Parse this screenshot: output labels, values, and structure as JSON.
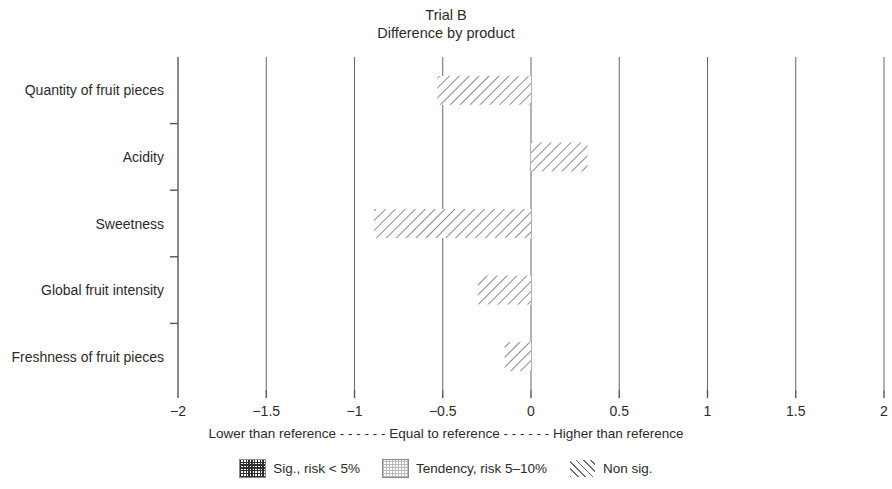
{
  "chart_data": {
    "type": "bar",
    "orientation": "horizontal",
    "title": "Trial B",
    "subtitle": "Difference by product",
    "xlabel": "",
    "ylabel": "",
    "xlim": [
      -2,
      2
    ],
    "xticks": [
      "−2",
      "−1.5",
      "−1",
      "−0.5",
      "0",
      "0.5",
      "1",
      "1.5",
      "2"
    ],
    "xtick_values": [
      -2,
      -1.5,
      -1,
      -0.5,
      0,
      0.5,
      1,
      1.5,
      2
    ],
    "grid": true,
    "grid_axis": "x",
    "categories": [
      "Quantity of fruit pieces",
      "Acidity",
      "Sweetness",
      "Global fruit intensity",
      "Freshness of fruit pieces"
    ],
    "values": [
      -0.53,
      0.32,
      -0.89,
      -0.3,
      -0.15
    ],
    "bar_significance": [
      "Non sig.",
      "Non sig.",
      "Non sig.",
      "Non sig.",
      "Non sig."
    ],
    "axis_caption": {
      "left": "Lower than reference",
      "dashes_left": "- - - - - -",
      "center": "Equal to reference",
      "dashes_right": "- - - - - -",
      "right": "Higher than reference"
    },
    "legend": {
      "position": "bottom",
      "entries": [
        {
          "label": "Sig., risk < 5%",
          "pattern": "dense-dark-dots",
          "swatch_class": "sw-sig"
        },
        {
          "label": "Tendency, risk 5–10%",
          "pattern": "light-dots",
          "swatch_class": "sw-tendency"
        },
        {
          "label": "Non sig.",
          "pattern": "diagonal-hatch",
          "swatch_class": "sw-nonsig"
        }
      ]
    },
    "colors": {
      "background": "#ffffff",
      "axis": "#555555",
      "grid": "#666666",
      "text": "#2b2b2b",
      "hatch": "#6e6e6e"
    }
  }
}
